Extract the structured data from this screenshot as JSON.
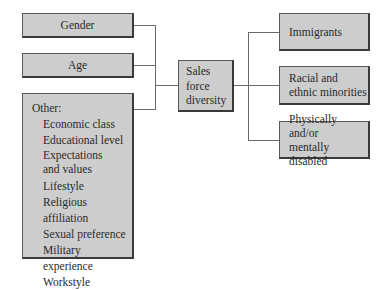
{
  "diagram": {
    "type": "flow",
    "center": {
      "label_lines": [
        "Sales",
        "force",
        "diversity"
      ]
    },
    "left_inputs": [
      {
        "label": "Gender"
      },
      {
        "label": "Age"
      },
      {
        "title": "Other:",
        "items": [
          "Economic class",
          "Educational level",
          "Expectations and values",
          "Lifestyle",
          "Religious affiliation",
          "Sexual preference",
          "Military experience",
          "Workstyle"
        ],
        "items_display": {
          "2": [
            "Expectations",
            "and values"
          ]
        }
      }
    ],
    "right_outputs": [
      {
        "label_lines": [
          "Immigrants"
        ]
      },
      {
        "label_lines": [
          "Racial and",
          "ethnic minorities"
        ]
      },
      {
        "label_lines": [
          "Physically and/or",
          "mentally disabled"
        ]
      }
    ],
    "colors": {
      "box_fill": "#cdcdcd",
      "box_border": "#3a3a3a",
      "connector": "#6a6a6a",
      "text": "#2a2a2a",
      "background": "#ffffff"
    }
  }
}
